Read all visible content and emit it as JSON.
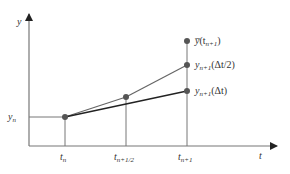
{
  "diagram": {
    "axes": {
      "y_label": "y",
      "x_label": "t"
    },
    "y_level": {
      "label_base": "y",
      "label_sub": "n"
    },
    "ticks": [
      {
        "base": "t",
        "sub": "n"
      },
      {
        "base": "t",
        "sub": "n+1/2"
      },
      {
        "base": "t",
        "sub": "n+1"
      }
    ],
    "points": [
      {
        "name": "exact",
        "base": "y̅",
        "arg_open": "(t",
        "arg_sub": "n+1",
        "arg_close": ")"
      },
      {
        "name": "half-step",
        "base": "y",
        "sub": "n+1",
        "arg": "(Δt/2)"
      },
      {
        "name": "full-step",
        "base": "y",
        "sub": "n+1",
        "arg": "(Δt)"
      }
    ],
    "colors": {
      "axis": "#555555",
      "line_half": "#666666",
      "line_full": "#222222",
      "point": "#555555",
      "text": "#333333"
    }
  }
}
